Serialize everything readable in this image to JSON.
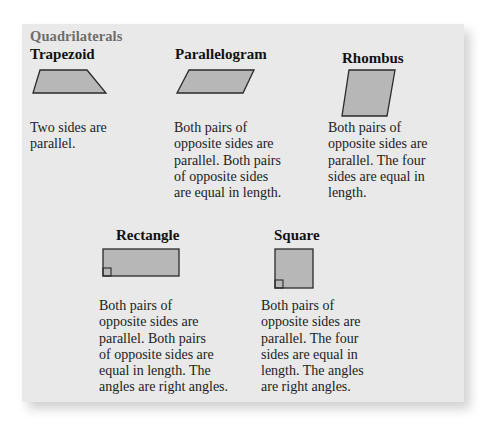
{
  "title": "Quadrilaterals",
  "colors": {
    "card_background": "#e9e9e9",
    "shape_fill": "#b7b7b7",
    "shape_stroke": "#2a2a2a",
    "title_color": "#6e6e6e"
  },
  "shapes": [
    {
      "name": "Trapezoid",
      "description_lines": [
        "Two sides are",
        "parallel."
      ]
    },
    {
      "name": "Parallelogram",
      "description_lines": [
        "Both pairs of",
        "opposite sides are",
        "parallel. Both pairs",
        "of opposite sides",
        "are equal in length."
      ]
    },
    {
      "name": "Rhombus",
      "description_lines": [
        "Both pairs of",
        "opposite sides are",
        "parallel. The four",
        "sides are equal in",
        "length."
      ]
    },
    {
      "name": "Rectangle",
      "description_lines": [
        "Both pairs of",
        "opposite sides are",
        "parallel. Both pairs",
        "of opposite sides are",
        "equal in length. The",
        "angles are right angles."
      ]
    },
    {
      "name": "Square",
      "description_lines": [
        "Both pairs of",
        "opposite sides are",
        "parallel. The four",
        "sides are equal in",
        "length. The angles",
        "are right angles."
      ]
    }
  ]
}
